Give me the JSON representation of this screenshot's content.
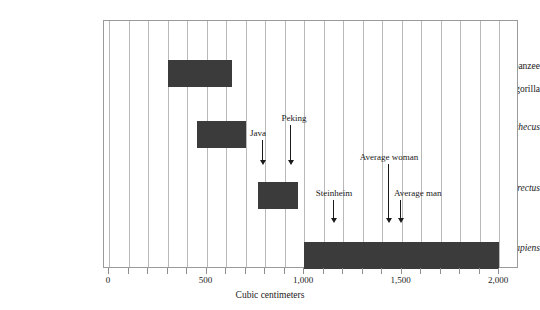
{
  "chart_data": {
    "type": "bar",
    "orientation": "horizontal-range",
    "title": "",
    "xlabel": "Cubic centimeters",
    "ylabel": "",
    "xlim": [
      0,
      2100
    ],
    "xticks": [
      0,
      500,
      1000,
      1500,
      2000
    ],
    "xticklabels": [
      "0",
      "500",
      "1,000",
      "1,500",
      "2,000"
    ],
    "grid": "vertical gridlines every 100 cc",
    "legend": "none",
    "categories": [
      "Chimpanzee\nand gorilla",
      "Australopithecus",
      "Homo erectus",
      "Homo sapiens"
    ],
    "ranges": [
      {
        "name": "Chimpanzee and gorilla",
        "low": 300,
        "high": 630
      },
      {
        "name": "Australopithecus",
        "low": 450,
        "high": 700
      },
      {
        "name": "Homo erectus",
        "low": 765,
        "high": 970
      },
      {
        "name": "Homo sapiens",
        "low": 1000,
        "high": 2000
      }
    ],
    "annotations": [
      {
        "label": "Java",
        "value": 790
      },
      {
        "label": "Peking",
        "value": 945
      },
      {
        "label": "Steinheim",
        "value": 1160
      },
      {
        "label": "Average woman",
        "value": 1440
      },
      {
        "label": "Average man",
        "value": 1500
      }
    ]
  },
  "axis": {
    "xlabel": "Cubic centimeters",
    "ticklabels": [
      "0",
      "500",
      "1,000",
      "1,500",
      "2,000"
    ]
  },
  "rows": [
    {
      "label_line1": "Chimpanzee",
      "label_line2": "and gorilla",
      "italic": false
    },
    {
      "label_line1": "Australopithecus",
      "label_line2": "",
      "italic": true
    },
    {
      "label_line1": "Homo erectus",
      "label_line2": "",
      "italic": true
    },
    {
      "label_line1": "Homo sapiens",
      "label_line2": "",
      "italic": true
    }
  ],
  "annotations": {
    "java": "Java",
    "peking": "Peking",
    "steinheim": "Steinheim",
    "average_woman": "Average woman",
    "average_man": "Average man"
  },
  "colors": {
    "bar": "#3b3b3b",
    "grid": "#b9b9b9",
    "frame": "#9a9a9a",
    "text": "#1a1a1a",
    "background": "#ffffff"
  }
}
